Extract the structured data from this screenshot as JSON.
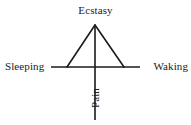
{
  "figure": {
    "type": "axis-diagram",
    "title": "",
    "background_color": "#ffffff",
    "stroke_color": "#1a1a1a"
  },
  "labels": {
    "top": "Ecstasy",
    "left": "Sleeping",
    "right": "Waking",
    "bottom": "Pain"
  },
  "geometry": {
    "origin": {
      "x": 95,
      "y": 67
    },
    "horizontal_axis": {
      "x1": 51,
      "y1": 67,
      "x2": 140,
      "y2": 67
    },
    "vertical_axis": {
      "x1": 95,
      "y1": 25,
      "x2": 95,
      "y2": 120
    },
    "triangle": {
      "apex": {
        "x": 95,
        "y": 25
      },
      "base_left": {
        "x": 67,
        "y": 67
      },
      "base_right": {
        "x": 124,
        "y": 67
      }
    },
    "stroke_width": 1.6
  }
}
